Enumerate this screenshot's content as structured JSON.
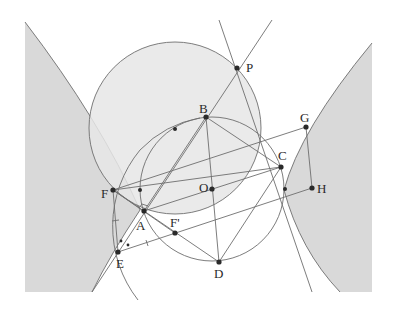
{
  "figure": {
    "colors": {
      "shade": "#d9d9d9",
      "circle_fill": "#e6e6e6",
      "line": "#6e6e6e",
      "point": "#2a2a2a"
    },
    "points": [
      {
        "id": "P",
        "label": "P",
        "x": 237,
        "y": 68,
        "lx": 246,
        "ly": 72
      },
      {
        "id": "B",
        "label": "B",
        "x": 206,
        "y": 117,
        "lx": 199,
        "ly": 113
      },
      {
        "id": "G",
        "label": "G",
        "x": 306,
        "y": 127,
        "lx": 300,
        "ly": 122
      },
      {
        "id": "C",
        "label": "C",
        "x": 281,
        "y": 167,
        "lx": 278,
        "ly": 160
      },
      {
        "id": "F",
        "label": "F",
        "x": 113,
        "y": 190,
        "lx": 101,
        "ly": 198
      },
      {
        "id": "O",
        "label": "O",
        "x": 212,
        "y": 189,
        "lx": 199,
        "ly": 192
      },
      {
        "id": "H",
        "label": "H",
        "x": 312,
        "y": 188,
        "lx": 317,
        "ly": 193
      },
      {
        "id": "A",
        "label": "A",
        "x": 144,
        "y": 211,
        "lx": 136,
        "ly": 230
      },
      {
        "id": "Fp",
        "label": "F'",
        "x": 175,
        "y": 233,
        "lx": 170,
        "ly": 227
      },
      {
        "id": "E",
        "label": "E",
        "x": 118,
        "y": 252,
        "lx": 116,
        "ly": 268
      },
      {
        "id": "D",
        "label": "D",
        "x": 219,
        "y": 262,
        "lx": 214,
        "ly": 278
      }
    ],
    "auxiliary_points": [
      {
        "x": 175,
        "y": 129
      },
      {
        "x": 140,
        "y": 190
      },
      {
        "x": 285,
        "y": 189
      },
      {
        "x": 122,
        "y": 241
      },
      {
        "x": 128,
        "y": 245
      }
    ]
  }
}
